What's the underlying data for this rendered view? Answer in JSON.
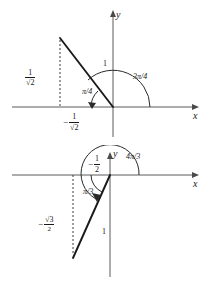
{
  "figure": {
    "diagrams": [
      {
        "id": "diagram-top",
        "angle_label": "3π/4",
        "reference_angle_label": "π/4",
        "hypotenuse_label": "1",
        "y_value_numerator": "1",
        "y_value_denominator": "√2",
        "x_value_sign": "−",
        "x_value_numerator": "1",
        "x_value_denominator": "√2",
        "axis_x_label": "x",
        "axis_y_label": "y"
      },
      {
        "id": "diagram-bottom",
        "angle_label": "4π/3",
        "reference_angle_label": "π/3",
        "hypotenuse_label": "1",
        "x_value_sign": "−",
        "x_value_numerator": "1",
        "x_value_denominator": "2",
        "y_value_sign": "−",
        "y_value_numerator": "√3",
        "y_value_denominator": "2",
        "axis_x_label": "x",
        "axis_y_label": "y"
      }
    ],
    "colors": {
      "axis": "#5a5a5a",
      "ray": "#1a1a1a",
      "dashed": "#3c3c3c",
      "arc": "#2a2a2a",
      "background": "#ffffff"
    }
  }
}
